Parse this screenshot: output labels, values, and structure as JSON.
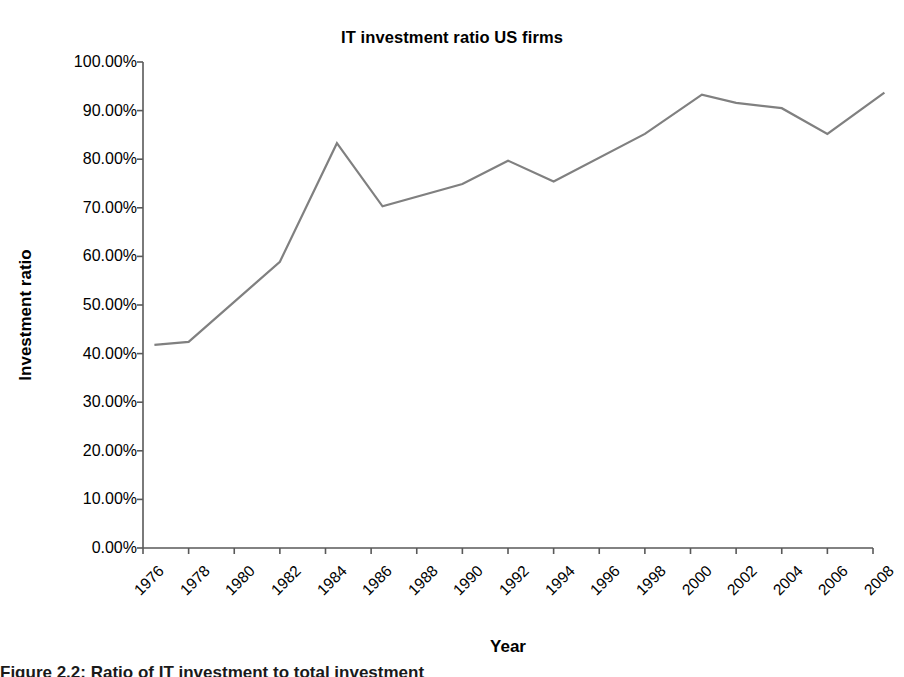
{
  "chart_data": {
    "type": "line",
    "title": "IT investment ratio US firms",
    "xlabel": "Year",
    "ylabel": "Investment ratio",
    "grid": false,
    "legend": "none",
    "line_color": "#808080",
    "axis_color": "#595959",
    "text_color": "#000000",
    "xlim": [
      1976,
      2008
    ],
    "ylim": [
      0,
      100
    ],
    "x_tick_labels": [
      "1976",
      "1978",
      "1980",
      "1982",
      "1984",
      "1986",
      "1988",
      "1990",
      "1992",
      "1994",
      "1996",
      "1998",
      "2000",
      "2002",
      "2004",
      "2006",
      "2008"
    ],
    "x_tick_values": [
      1976,
      1978,
      1980,
      1982,
      1984,
      1986,
      1988,
      1990,
      1992,
      1994,
      1996,
      1998,
      2000,
      2002,
      2004,
      2006,
      2008
    ],
    "y_tick_labels": [
      "0.00%",
      "10.00%",
      "20.00%",
      "30.00%",
      "40.00%",
      "50.00%",
      "60.00%",
      "70.00%",
      "80.00%",
      "90.00%",
      "100.00%"
    ],
    "y_tick_values": [
      0,
      10,
      20,
      30,
      40,
      50,
      60,
      70,
      80,
      90,
      100
    ],
    "x": [
      1976.5,
      1978,
      1982,
      1984.5,
      1986.5,
      1990,
      1992,
      1994,
      1998,
      2000.5,
      2002,
      2004,
      2006,
      2008.5
    ],
    "values": [
      41.8,
      42.4,
      58.9,
      83.3,
      70.3,
      74.9,
      79.7,
      75.4,
      85.2,
      93.3,
      91.6,
      90.5,
      85.2,
      93.7
    ],
    "series": [
      {
        "name": "IT investment ratio",
        "x": [
          1976.5,
          1978,
          1982,
          1984.5,
          1986.5,
          1990,
          1992,
          1994,
          1998,
          2000.5,
          2002,
          2004,
          2006,
          2008.5
        ],
        "values": [
          41.8,
          42.4,
          58.9,
          83.3,
          70.3,
          74.9,
          79.7,
          75.4,
          85.2,
          93.3,
          91.6,
          90.5,
          85.2,
          93.7
        ]
      }
    ]
  },
  "caption": {
    "fragment": "Figure 2.2: Ratio of IT investment to total investment"
  }
}
